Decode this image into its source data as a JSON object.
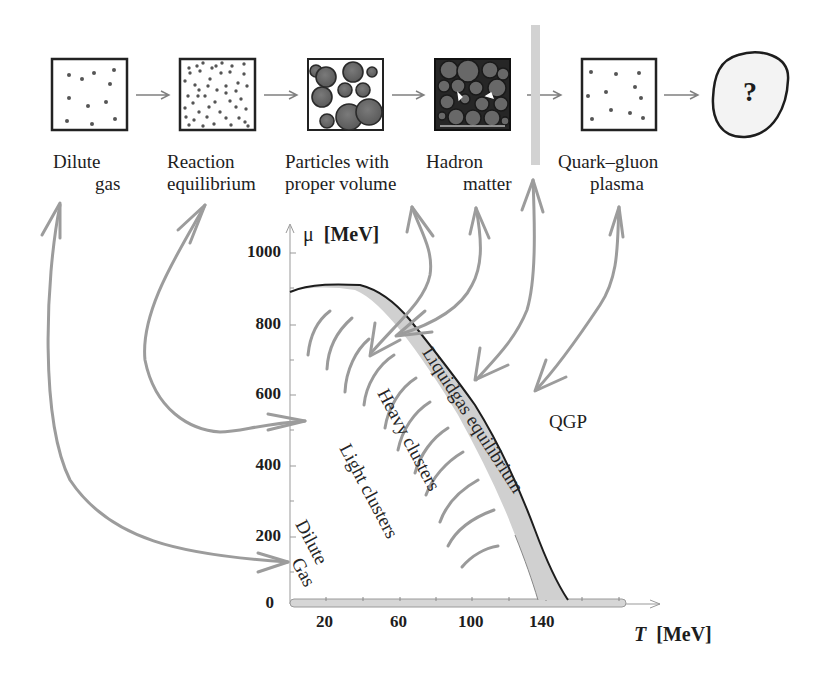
{
  "stages": [
    {
      "label_line1": "Dilute",
      "label_line2": "gas",
      "icon": "sparse-dots-box"
    },
    {
      "label_line1": "Reaction",
      "label_line2": "equilibrium",
      "icon": "dense-dots-box"
    },
    {
      "label_line1": "Particles with",
      "label_line2": "proper volume",
      "icon": "spheres-box"
    },
    {
      "label_line1": "Hadron",
      "label_line2": "matter",
      "icon": "packed-spheres-box"
    },
    {
      "label_line1": "Quark–gluon",
      "label_line2": "plasma",
      "icon": "sparse-dots-box"
    },
    {
      "label_line1": "",
      "label_line2": "",
      "icon": "question-blob",
      "symbol": "?"
    }
  ],
  "axes": {
    "y_label_symbol": "μ",
    "y_label_unit": "[MeV]",
    "x_label_symbol": "T",
    "x_label_unit": "[MeV]",
    "y_ticks": [
      "1000",
      "800",
      "600",
      "400",
      "200",
      "0"
    ],
    "x_ticks": [
      "20",
      "60",
      "100",
      "140"
    ]
  },
  "regions": {
    "liquidgas": "Liquidgas equilibrium",
    "heavy": "Heavy clusters",
    "light": "Light clusters",
    "dilute_line1": "Dilute",
    "dilute_line2": "Gas",
    "qgp": "QGP"
  },
  "colors": {
    "band_fill": "#cfcfcf",
    "arrow_gray": "#9a9a9a",
    "ink": "#1d1d1d",
    "sphere_fill": "#6b6b6b"
  }
}
